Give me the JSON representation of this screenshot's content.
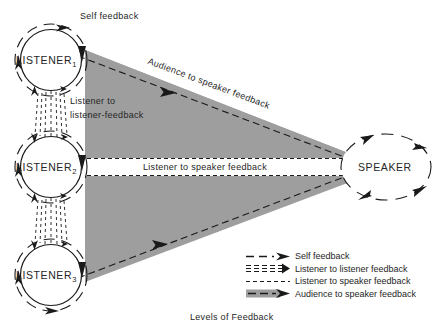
{
  "figure": {
    "caption": "Levels of Feedback",
    "colors": {
      "wedge_gray": "#9e9e9e",
      "ink": "#1a1a1a",
      "background": "#ffffff"
    }
  },
  "nodes": [
    {
      "name": "listener-1",
      "label": "LISTENER",
      "subscript": "1",
      "shape": "circle"
    },
    {
      "name": "listener-2",
      "label": "LISTENER",
      "subscript": "2",
      "shape": "circle"
    },
    {
      "name": "listener-3",
      "label": "LISTENER",
      "subscript": "3",
      "shape": "circle"
    },
    {
      "name": "speaker",
      "label": "SPEAKER",
      "subscript": "",
      "shape": "ellipse"
    }
  ],
  "edge_labels": {
    "self_feedback": "Self feedback",
    "listener_to_listener_line1": "Listener to",
    "listener_to_listener_line2": "listener-feedback",
    "listener_to_speaker": "Listener to speaker feedback",
    "audience_to_speaker": "Audience to speaker feedback"
  },
  "legend": {
    "items": [
      {
        "key": "dashed-arrow",
        "label": "Self feedback"
      },
      {
        "key": "double-dashed-band-arrow",
        "label": "Listener to listener feedback"
      },
      {
        "key": "fine-dashed",
        "label": "Listener to speaker feedback"
      },
      {
        "key": "gray-band-arrow",
        "label": "Audience to speaker feedback"
      }
    ]
  }
}
